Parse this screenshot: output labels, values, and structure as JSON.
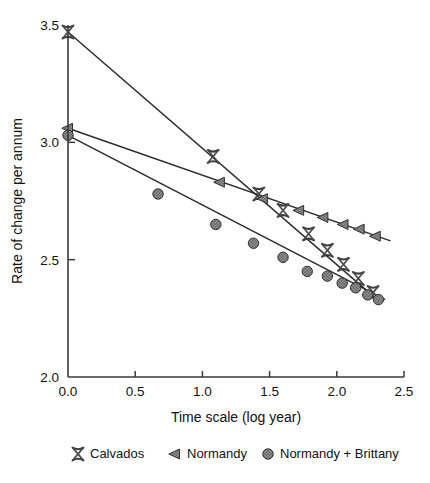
{
  "chart_data": {
    "type": "scatter",
    "title": "",
    "xlabel": "Time scale (log year)",
    "ylabel": "Rate of change per annum",
    "xlim": [
      0.0,
      2.5
    ],
    "ylim": [
      2.0,
      3.5
    ],
    "xticks": [
      "0.0",
      "0.5",
      "1.0",
      "1.5",
      "2.0",
      "2.5"
    ],
    "yticks": [
      "2.0",
      "2.5",
      "3.0",
      "3.5"
    ],
    "xtick_values": [
      0.0,
      0.5,
      1.0,
      1.5,
      2.0,
      2.5
    ],
    "ytick_values": [
      2.0,
      2.5,
      3.0,
      3.5
    ],
    "grid": false,
    "legend_position": "bottom",
    "series": [
      {
        "name": "Calvados",
        "marker": "x-cross",
        "color": "#4d4d4d",
        "fit_line": {
          "x": [
            0.0,
            2.32
          ],
          "y": [
            3.47,
            2.32
          ]
        },
        "points": [
          {
            "x": 0.0,
            "y": 3.47
          },
          {
            "x": 1.08,
            "y": 2.94
          },
          {
            "x": 1.42,
            "y": 2.78
          },
          {
            "x": 1.6,
            "y": 2.71
          },
          {
            "x": 1.79,
            "y": 2.61
          },
          {
            "x": 1.93,
            "y": 2.54
          },
          {
            "x": 2.05,
            "y": 2.48
          },
          {
            "x": 2.16,
            "y": 2.42
          },
          {
            "x": 2.27,
            "y": 2.36
          }
        ]
      },
      {
        "name": "Normandy",
        "marker": "left-triangle",
        "color": "#6b6b6b",
        "fit_line": {
          "x": [
            0.0,
            2.4
          ],
          "y": [
            3.06,
            2.58
          ]
        },
        "points": [
          {
            "x": 0.0,
            "y": 3.06
          },
          {
            "x": 1.13,
            "y": 2.83
          },
          {
            "x": 1.45,
            "y": 2.76
          },
          {
            "x": 1.72,
            "y": 2.71
          },
          {
            "x": 1.9,
            "y": 2.68
          },
          {
            "x": 2.05,
            "y": 2.65
          },
          {
            "x": 2.17,
            "y": 2.63
          },
          {
            "x": 2.29,
            "y": 2.6
          }
        ]
      },
      {
        "name": "Normandy + Brittany",
        "marker": "circle",
        "color": "#7a7a7a",
        "fit_line": {
          "x": [
            0.0,
            2.36
          ],
          "y": [
            3.03,
            2.33
          ]
        },
        "points": [
          {
            "x": 0.0,
            "y": 3.03
          },
          {
            "x": 0.67,
            "y": 2.78
          },
          {
            "x": 1.1,
            "y": 2.65
          },
          {
            "x": 1.38,
            "y": 2.57
          },
          {
            "x": 1.6,
            "y": 2.51
          },
          {
            "x": 1.78,
            "y": 2.45
          },
          {
            "x": 1.93,
            "y": 2.43
          },
          {
            "x": 2.04,
            "y": 2.4
          },
          {
            "x": 2.14,
            "y": 2.38
          },
          {
            "x": 2.23,
            "y": 2.35
          },
          {
            "x": 2.31,
            "y": 2.33
          }
        ]
      }
    ]
  },
  "legend": {
    "entries": [
      {
        "label": "Calvados",
        "marker": "x-cross"
      },
      {
        "label": "Normandy",
        "marker": "left-triangle"
      },
      {
        "label": "Normandy + Brittany",
        "marker": "circle"
      }
    ]
  }
}
